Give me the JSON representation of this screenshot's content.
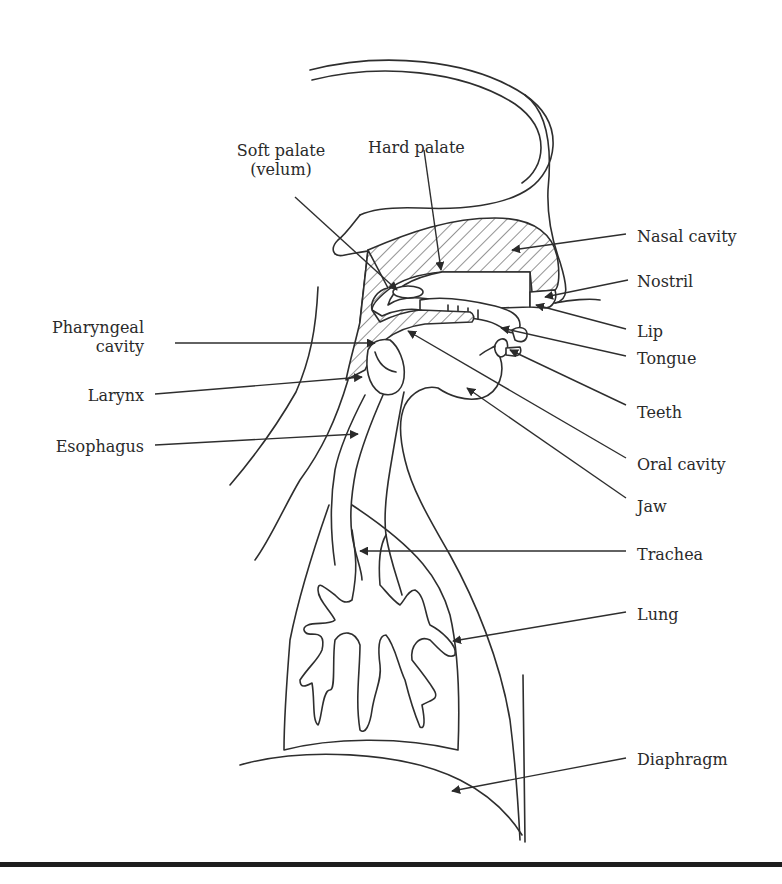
{
  "figure": {
    "kind": "anatomical diagram",
    "colors": {
      "line": "#2e2e2e",
      "text": "#2a2a2a",
      "background": "#ffffff",
      "rule": "#1e1e1e"
    }
  },
  "labels": {
    "soft_palate": {
      "text": "Soft palate\n(velum)",
      "x": 222,
      "y": 141,
      "align": "center",
      "w": 118
    },
    "hard_palate": {
      "text": "Hard palate",
      "x": 368,
      "y": 138,
      "align": "left"
    },
    "nasal_cavity": {
      "text": "Nasal cavity",
      "x": 637,
      "y": 227,
      "align": "left"
    },
    "nostril": {
      "text": "Nostril",
      "x": 637,
      "y": 272,
      "align": "left"
    },
    "lip": {
      "text": "Lip",
      "x": 637,
      "y": 322,
      "align": "left"
    },
    "tongue": {
      "text": "Tongue",
      "x": 637,
      "y": 349,
      "align": "left"
    },
    "teeth": {
      "text": "Teeth",
      "x": 637,
      "y": 403,
      "align": "left"
    },
    "oral_cavity": {
      "text": "Oral cavity",
      "x": 637,
      "y": 455,
      "align": "left"
    },
    "jaw": {
      "text": "Jaw",
      "x": 637,
      "y": 497,
      "align": "left"
    },
    "trachea": {
      "text": "Trachea",
      "x": 637,
      "y": 545,
      "align": "left"
    },
    "lung": {
      "text": "Lung",
      "x": 637,
      "y": 605,
      "align": "left"
    },
    "diaphragm": {
      "text": "Diaphragm",
      "x": 637,
      "y": 750,
      "align": "left"
    },
    "pharyngeal_cavity": {
      "text": "Pharyngeal\n     cavity",
      "x": 44,
      "y": 318,
      "align": "right",
      "w": 100
    },
    "larynx": {
      "text": "Larynx",
      "x": 82,
      "y": 386,
      "align": "right",
      "w": 62
    },
    "esophagus": {
      "text": "Esophagus",
      "x": 48,
      "y": 437,
      "align": "right",
      "w": 96
    }
  },
  "leaders": [
    {
      "name": "soft-palate-leader",
      "x1": 295,
      "y1": 197,
      "x2": 397,
      "y2": 290
    },
    {
      "name": "hard-palate-leader",
      "x1": 424,
      "y1": 150,
      "x2": 441,
      "y2": 270
    },
    {
      "name": "nasal-cavity-leader",
      "x1": 626,
      "y1": 234,
      "x2": 512,
      "y2": 250
    },
    {
      "name": "nostril-leader",
      "x1": 628,
      "y1": 280,
      "x2": 545,
      "y2": 297
    },
    {
      "name": "lip-leader",
      "x1": 626,
      "y1": 329,
      "x2": 536,
      "y2": 305
    },
    {
      "name": "tongue-leader",
      "x1": 626,
      "y1": 356,
      "x2": 501,
      "y2": 328
    },
    {
      "name": "teeth-leader",
      "x1": 626,
      "y1": 405,
      "x2": 510,
      "y2": 350
    },
    {
      "name": "oral-cavity-leader",
      "x1": 626,
      "y1": 458,
      "x2": 408,
      "y2": 331
    },
    {
      "name": "jaw-leader",
      "x1": 626,
      "y1": 498,
      "x2": 467,
      "y2": 388
    },
    {
      "name": "trachea-leader",
      "x1": 626,
      "y1": 551,
      "x2": 360,
      "y2": 551
    },
    {
      "name": "lung-leader",
      "x1": 626,
      "y1": 612,
      "x2": 453,
      "y2": 641
    },
    {
      "name": "diaphragm-leader",
      "x1": 626,
      "y1": 758,
      "x2": 452,
      "y2": 791
    },
    {
      "name": "pharyngeal-cavity-leader",
      "x1": 175,
      "y1": 343,
      "x2": 375,
      "y2": 343
    },
    {
      "name": "larynx-leader",
      "x1": 155,
      "y1": 394,
      "x2": 362,
      "y2": 377
    },
    {
      "name": "esophagus-leader",
      "x1": 155,
      "y1": 445,
      "x2": 358,
      "y2": 434
    }
  ]
}
